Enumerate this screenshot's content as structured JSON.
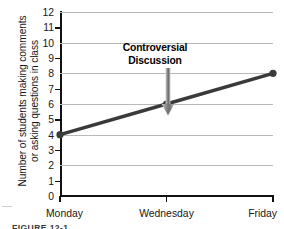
{
  "figure": {
    "caption": "FIGURE 12-1"
  },
  "chart_data": {
    "type": "line",
    "title": "",
    "xlabel": "",
    "ylabel": "Number of students making comments or asking questions in class",
    "ylabel_lines": [
      "Number of students making comments",
      "or asking questions in class"
    ],
    "categories": [
      "Monday",
      "Wednesday",
      "Friday"
    ],
    "values": [
      4,
      6,
      8
    ],
    "series": [
      {
        "name": "Students participating",
        "values": [
          4,
          6,
          8
        ]
      }
    ],
    "ylim": [
      0,
      12
    ],
    "ytick_values": [
      0,
      1,
      2,
      3,
      4,
      5,
      6,
      7,
      8,
      9,
      10,
      11,
      12
    ],
    "ytick_labels": [
      "0",
      "1",
      "2",
      "3",
      "4",
      "5",
      "6",
      "7",
      "8",
      "9",
      "10",
      "11",
      "12"
    ],
    "gridline_values": [
      2,
      4,
      6,
      8,
      10,
      12
    ],
    "grid": true,
    "legend": "none",
    "annotations": [
      {
        "text_lines": [
          "Controversial",
          "Discussion"
        ],
        "text": "Controversial Discussion",
        "points_to_category": "Wednesday",
        "points_to_value": 6,
        "arrow": "down-arrow-icon"
      }
    ],
    "colors": {
      "line": "#3a3a3a",
      "marker": "#3a3a3a",
      "grid": "#b9b9b9",
      "axis": "#111111",
      "arrow": "#8e8e8e",
      "background": "#ffffff"
    }
  }
}
